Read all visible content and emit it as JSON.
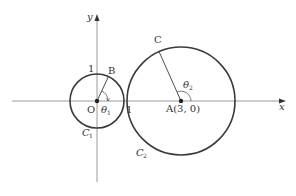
{
  "diagram": {
    "axes": {
      "x_label": "x",
      "y_label": "y"
    },
    "origin_label": "O",
    "tick_labels": {
      "y_one": "1",
      "x_one": "1"
    },
    "points": {
      "B": "B",
      "C": "C",
      "A": "A(3, 0)"
    },
    "angles": {
      "theta1": "θ",
      "theta1_sub": "1",
      "theta2": "θ",
      "theta2_sub": "2"
    },
    "circles": {
      "C1": "C",
      "C1_sub": "1",
      "C2": "C",
      "C2_sub": "2"
    },
    "colors": {
      "axis": "#9a9a9a",
      "circle": "#3a3a3a",
      "text": "#333333"
    }
  }
}
